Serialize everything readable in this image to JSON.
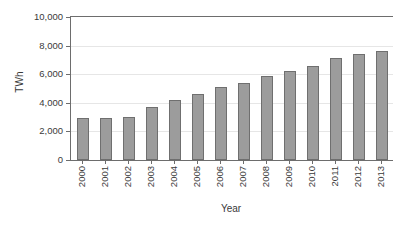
{
  "chart_data": {
    "type": "bar",
    "title": "",
    "xlabel": "Year",
    "ylabel": "TWh",
    "categories": [
      "2000",
      "2001",
      "2002",
      "2003",
      "2004",
      "2005",
      "2006",
      "2007",
      "2008",
      "2009",
      "2010",
      "2011",
      "2012",
      "2013"
    ],
    "values": [
      2940,
      2940,
      3000,
      3700,
      4200,
      4600,
      5100,
      5400,
      5900,
      6200,
      6550,
      7100,
      7400,
      7600
    ],
    "series": [
      {
        "name": "TWh",
        "values": [
          2940,
          2940,
          3000,
          3700,
          4200,
          4600,
          5100,
          5400,
          5900,
          6200,
          6550,
          7100,
          7400,
          7600
        ]
      }
    ],
    "ylim": [
      0,
      10000
    ],
    "ytick_values": [
      0,
      2000,
      4000,
      6000,
      8000,
      10000
    ],
    "ytick_labels": [
      "0",
      "2,000",
      "4,000",
      "6,000",
      "8,000",
      "10,000"
    ],
    "grid": true,
    "legend": false,
    "bar_color": "#9c9c9c",
    "bar_edge_color": "#6f6f6f",
    "axis_color": "#6d6d6d",
    "grid_color": "#e6e6e6",
    "background": "#ffffff"
  }
}
